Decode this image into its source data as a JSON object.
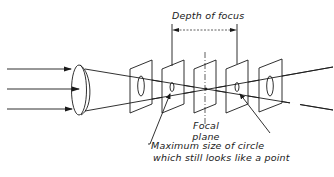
{
  "labels": {
    "depth_of_focus": "Depth of focus",
    "focal_plane_line1": "Focal",
    "focal_plane_line2": "plane",
    "max_circle_line1": "Maximum  size  of  circle",
    "max_circle_line2": "which  still  looks  like  a  point"
  },
  "colors": {
    "line": "#1a1a1a",
    "background": "#ffffff"
  },
  "diagram": {
    "incoming_rays": 3,
    "planes": [
      {
        "name": "plane-1",
        "circle": "large"
      },
      {
        "name": "plane-2",
        "circle": "small"
      },
      {
        "name": "focal-plane",
        "circle": "point"
      },
      {
        "name": "plane-4",
        "circle": "small"
      },
      {
        "name": "plane-5",
        "circle": "large"
      }
    ]
  }
}
